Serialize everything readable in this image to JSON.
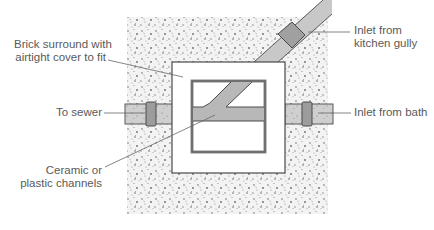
{
  "labels": {
    "brick_surround": [
      "Brick surround with",
      "airtight cover to fit"
    ],
    "to_sewer": "To sewer",
    "ceramic_channels": [
      "Ceramic or",
      "plastic channels"
    ],
    "inlet_kitchen": [
      "Inlet from",
      "kitchen gully"
    ],
    "inlet_bath": "Inlet from bath"
  },
  "colors": {
    "gravel_bg": "#f2f2f2",
    "gravel_dots": "#6e6e6e",
    "pipe_fill": "#c4c4c4",
    "joint_fill": "#9a9a9a",
    "channel_fill": "#b4b4b4",
    "outline": "#4a4a4a",
    "leader": "#666666",
    "text": "#5a5a5a"
  }
}
